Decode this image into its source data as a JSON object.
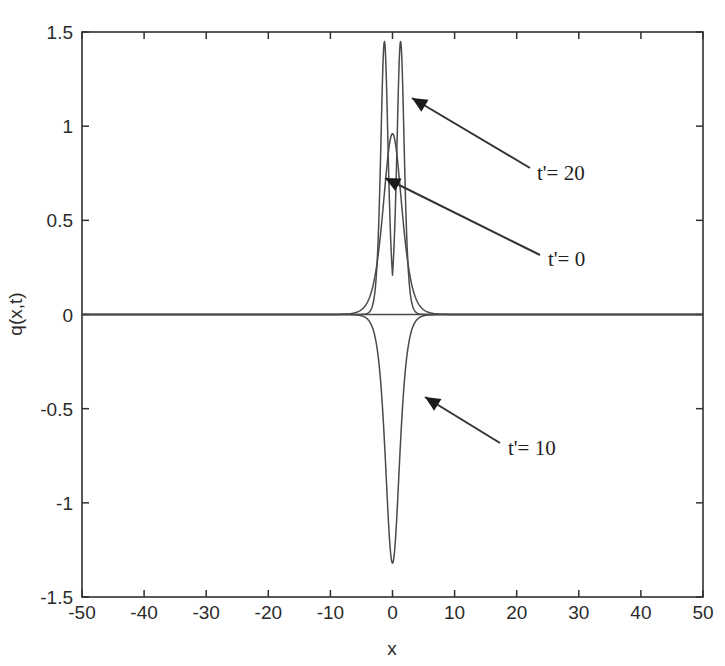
{
  "chart_data": {
    "type": "line",
    "title": "",
    "xlabel": "x",
    "ylabel": "q(x,t)",
    "xlim": [
      -50,
      50
    ],
    "ylim": [
      -1.5,
      1.5
    ],
    "grid": false,
    "legend_position": "inline-annotations",
    "x_ticks": [
      "-50",
      "-40",
      "-30",
      "-20",
      "-10",
      "0",
      "10",
      "20",
      "30",
      "40",
      "50"
    ],
    "x_tick_values": [
      -50,
      -40,
      -30,
      -20,
      -10,
      0,
      10,
      20,
      30,
      40,
      50
    ],
    "y_ticks": [
      "1.5",
      "1",
      "0.5",
      "0",
      "-0.5",
      "-1",
      "-1.5"
    ],
    "y_tick_values": [
      1.5,
      1,
      0.5,
      0,
      -0.5,
      -1,
      -1.5
    ],
    "series": [
      {
        "name": "t'= 0",
        "annotation": "t'= 0",
        "peak_x": 0,
        "peak_y": 0.96,
        "shape": "single-sech-squared-pulse",
        "width": 4.0,
        "color": "#4a4a4a"
      },
      {
        "name": "t'= 20",
        "annotation": "t'= 20",
        "peak_x": [
          -1.3,
          1.3
        ],
        "peak_y": 1.45,
        "shape": "twin-narrow-peaks",
        "width": 1.6,
        "color": "#4a4a4a"
      },
      {
        "name": "t'= 10",
        "annotation": "t'= 10",
        "peak_x": 0,
        "peak_y": -1.32,
        "shape": "single-inverted-pulse",
        "width": 3.0,
        "color": "#4a4a4a"
      }
    ],
    "annotations": [
      {
        "label": "t'= 20",
        "label_x": 537,
        "label_y": 180,
        "arrow_tip_x": 412,
        "arrow_tip_y": 98,
        "arrow_tail_x": 530,
        "arrow_tail_y": 168
      },
      {
        "label": "t'= 0",
        "label_x": 548,
        "label_y": 266,
        "arrow_tip_x": 385,
        "arrow_tip_y": 178,
        "arrow_tail_x": 540,
        "arrow_tail_y": 255
      },
      {
        "label": "t'= 10",
        "label_x": 508,
        "label_y": 455,
        "arrow_tip_x": 425,
        "arrow_tip_y": 397,
        "arrow_tail_x": 500,
        "arrow_tail_y": 443
      }
    ]
  }
}
